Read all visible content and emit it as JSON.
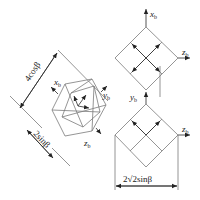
{
  "figure": {
    "type": "geometric-projection-diagram",
    "axes": {
      "x": {
        "symbol": "x",
        "subscript": "b"
      },
      "y": {
        "symbol": "y",
        "subscript": "b"
      },
      "z": {
        "symbol": "z",
        "subscript": "b"
      }
    },
    "dimensions": {
      "diagonal_long": "4cosβ",
      "diagonal_short": "2sinβ",
      "width": "2√2sinβ"
    },
    "colors": {
      "line": "#7a7a7a",
      "arrow": "#2a2a2a",
      "text": "#222222"
    },
    "components": [
      {
        "name": "rotated-hexagon-view",
        "labels": [
          "x_b",
          "y_b",
          "z_b"
        ]
      },
      {
        "name": "top-diamond-view",
        "labels": [
          "x_b",
          "z_b"
        ]
      },
      {
        "name": "bottom-diamond-view",
        "labels": [
          "y_b",
          "z_b"
        ]
      }
    ]
  }
}
